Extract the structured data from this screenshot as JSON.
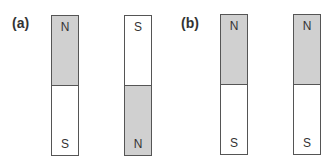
{
  "panels": [
    {
      "label": "(a)",
      "magnets": [
        {
          "top": {
            "pole": "N",
            "shaded": true
          },
          "bottom": {
            "pole": "S",
            "shaded": false
          }
        },
        {
          "top": {
            "pole": "S",
            "shaded": false
          },
          "bottom": {
            "pole": "N",
            "shaded": true
          }
        }
      ]
    },
    {
      "label": "(b)",
      "magnets": [
        {
          "top": {
            "pole": "N",
            "shaded": true
          },
          "bottom": {
            "pole": "S",
            "shaded": false
          }
        },
        {
          "top": {
            "pole": "N",
            "shaded": true
          },
          "bottom": {
            "pole": "S",
            "shaded": false
          }
        }
      ]
    }
  ],
  "colors": {
    "shaded_pole": "#d0d0d0",
    "plain_pole": "#ffffff",
    "outline": "#555555"
  }
}
